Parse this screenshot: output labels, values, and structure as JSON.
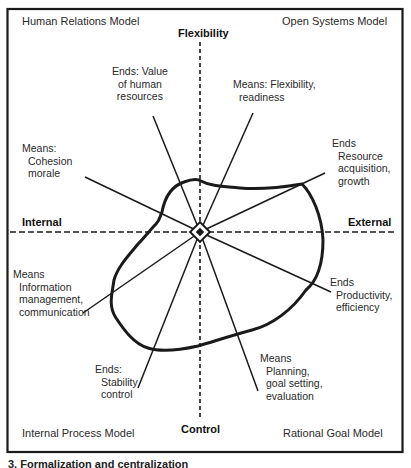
{
  "quadrants": {
    "top_left": "Human Relations Model",
    "top_right": "Open Systems Model",
    "bottom_left": "Internal Process Model",
    "bottom_right": "Rational Goal Model"
  },
  "axes": {
    "top": "Flexibility",
    "bottom": "Control",
    "left": "Internal",
    "right": "External"
  },
  "spokes": [
    {
      "id": "value-human-resources",
      "lines": [
        "Ends: Value",
        "of human",
        "resources"
      ]
    },
    {
      "id": "flexibility-readiness",
      "lines": [
        "Means: Flexibility,",
        "readiness"
      ]
    },
    {
      "id": "resource-acquisition",
      "lines": [
        "Ends",
        "Resource",
        "acquisition,",
        "growth"
      ]
    },
    {
      "id": "cohesion-morale",
      "lines": [
        "Means:",
        "Cohesion",
        "morale"
      ]
    },
    {
      "id": "information-management",
      "lines": [
        "Means",
        "Information",
        "management,",
        "communication"
      ]
    },
    {
      "id": "stability-control",
      "lines": [
        "Ends:",
        "Stability",
        "control"
      ]
    },
    {
      "id": "planning",
      "lines": [
        "Means",
        "Planning,",
        "goal setting,",
        "evaluation"
      ]
    },
    {
      "id": "productivity",
      "lines": [
        "Ends",
        "Productivity,",
        "efficiency"
      ]
    }
  ],
  "caption": "3.   Formalization and centralization",
  "colors": {
    "ink": "#1a1a1a",
    "background": "#ffffff"
  }
}
